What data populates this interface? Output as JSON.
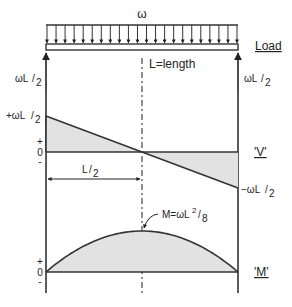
{
  "diagram": {
    "load_symbol": "ω",
    "load_label": "Load",
    "length_label": "L=length",
    "left_reaction": {
      "base": "ωL",
      "den": "2"
    },
    "right_reaction": {
      "base": "ωL",
      "den": "2"
    },
    "load_arrow_count": 22,
    "shear": {
      "label": "'V'",
      "max_label": {
        "base": "+ωL",
        "den": "2"
      },
      "min_label": {
        "base": "−ωL",
        "den": "2"
      },
      "plus": "+",
      "zero": "0",
      "minus": "-",
      "half_span_label": {
        "base": "L",
        "den": "2"
      },
      "values_fraction": [
        1,
        0,
        -1
      ]
    },
    "moment": {
      "label": "'M'",
      "max_label": {
        "base": "M=ωL",
        "sup": "2",
        "den": "8"
      },
      "plus": "+",
      "zero": "0",
      "minus": "-",
      "shape": "parabola",
      "peak_position_fraction": 0.5
    }
  }
}
